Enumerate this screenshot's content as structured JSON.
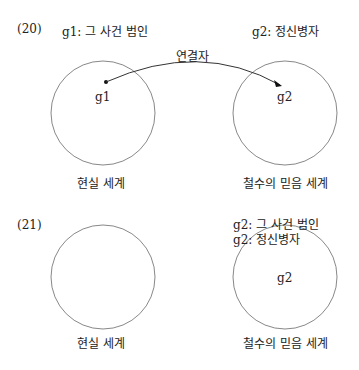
{
  "figure20": {
    "number": "(20)",
    "left_label": "g1: 그 사건 범인",
    "right_label": "g2: 정신병자",
    "connector_label": "연결자",
    "left_node": "g1",
    "right_node": "g2",
    "left_world": "현실 세계",
    "right_world": "철수의 믿음 세계"
  },
  "figure21": {
    "number": "(21)",
    "right_label_1": "g2: 그 사건 범인",
    "right_label_2": "g2: 정신병자",
    "right_node": "g2",
    "left_world": "현실 세계",
    "right_world": "철수의 믿음 세계"
  }
}
